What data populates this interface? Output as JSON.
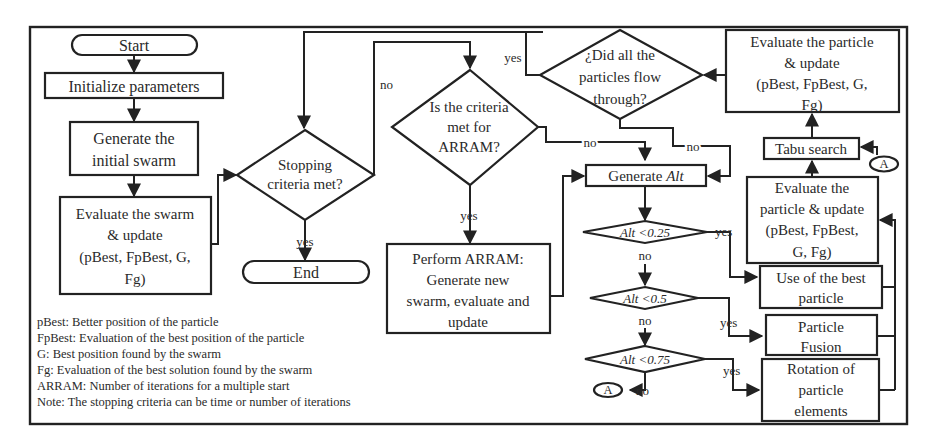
{
  "nodes": {
    "start": "Start",
    "init": "Initialize parameters",
    "generate_initial": [
      "Generate the",
      "initial swarm"
    ],
    "evaluate_swarm": [
      "Evaluate the swarm",
      "& update",
      "(pBest, FpBest, G,",
      "Fg)"
    ],
    "stopping": [
      "Stopping",
      "criteria met?"
    ],
    "end": "End",
    "arram_check": [
      "Is the criteria",
      "met for",
      "ARRAM?"
    ],
    "perform_arram": [
      "Perform ARRAM:",
      "Generate new",
      "swarm, evaluate and",
      "update"
    ],
    "all_flow": [
      "¿Did all the",
      "particles flow",
      "through?"
    ],
    "eval_particle_top": [
      "Evaluate the particle",
      "& update",
      "(pBest, FpBest, G,",
      "Fg)"
    ],
    "tabu": "Tabu search",
    "eval_particle_mid": [
      "Evaluate the",
      "particle & update",
      "(pBest, FpBest,",
      "G, Fg)"
    ],
    "generate_alt": {
      "prefix": "Generate ",
      "var": "Alt"
    },
    "alt_025": {
      "var": "Alt",
      "cond": " <0.25"
    },
    "alt_05": {
      "var": "Alt",
      "cond": " <0.5"
    },
    "alt_075": {
      "var": "Alt",
      "cond": " <0.75"
    },
    "use_best": [
      "Use of the best",
      "particle"
    ],
    "fusion": [
      "Particle",
      "Fusion"
    ],
    "rotation": [
      "Rotation of",
      "particle",
      "elements"
    ],
    "connector": "A"
  },
  "labels": {
    "yes": "yes",
    "no": "no"
  },
  "legend": [
    "pBest: Better position of the particle",
    "FpBest: Evaluation of the best position of the particle",
    "G: Best position found by the swarm",
    "Fg: Evaluation of the best solution found by the swarm",
    "ARRAM: Number of iterations for a multiple start",
    "Note: The stopping criteria can be time or number of iterations"
  ]
}
